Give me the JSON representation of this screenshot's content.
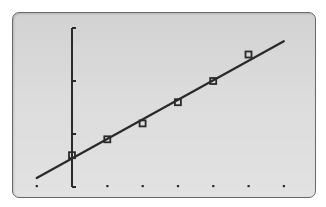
{
  "screen": {
    "type": "graphing-calculator-display",
    "background_color": "#d8d8d8",
    "ink_color": "#2a2a2a",
    "frame_color": "#6a6a6a"
  },
  "chart_data": {
    "type": "scatter",
    "title": "",
    "xlabel": "",
    "ylabel": "",
    "grid": false,
    "legend": null,
    "marker": "open-square",
    "x_tick_step": 1,
    "y_tick_step": 1,
    "xlim": [
      -1,
      6
    ],
    "ylim": [
      0,
      3
    ],
    "x_ticks": [
      -1,
      0,
      1,
      2,
      3,
      4,
      5,
      6
    ],
    "y_ticks": [
      0,
      1,
      2,
      3
    ],
    "series": [
      {
        "name": "data",
        "x": [
          0,
          1,
          2,
          3,
          4,
          5
        ],
        "y": [
          0.6,
          0.9,
          1.2,
          1.6,
          2.0,
          2.5
        ]
      }
    ],
    "regression_line": {
      "name": "best-fit line",
      "x": [
        -1,
        6
      ],
      "y": [
        0.17,
        2.75
      ]
    }
  },
  "pixel_map": {
    "x_origin_px": 72,
    "y_origin_px": 187,
    "px_per_x_unit": 35.3,
    "px_per_y_unit": 53
  }
}
